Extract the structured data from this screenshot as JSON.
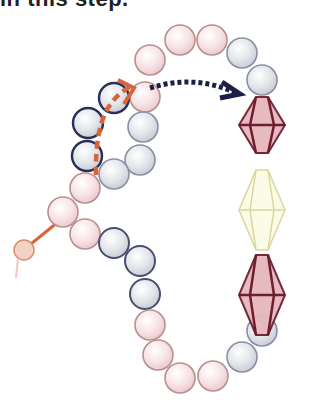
{
  "caption": "in this step.",
  "colors": {
    "pink_fill": "#f7e1e4",
    "pink_stroke": "#b8908f",
    "gray_fill": "#dfe3e8",
    "gray_stroke": "#8a8fa6",
    "dark_ring": "#2a2f58",
    "thread": "#d9643a",
    "arrow": "#1c1f45",
    "diamond_pink_fill": "#e6b7bd",
    "diamond_pink_stroke": "#6e1e30",
    "diamond_yellow_fill": "#fbfbe8",
    "diamond_yellow_stroke": "#d8d89a"
  },
  "beads": [
    {
      "type": "pink",
      "x": 150,
      "y": 60
    },
    {
      "type": "pink",
      "x": 180,
      "y": 40
    },
    {
      "type": "pink",
      "x": 212,
      "y": 40
    },
    {
      "type": "gray",
      "x": 242,
      "y": 53
    },
    {
      "type": "gray",
      "x": 262,
      "y": 80
    },
    {
      "type": "pink",
      "x": 145,
      "y": 97
    },
    {
      "type": "gray-dark",
      "x": 114,
      "y": 98
    },
    {
      "type": "gray-dark",
      "x": 88,
      "y": 123
    },
    {
      "type": "gray-dark",
      "x": 87,
      "y": 156
    },
    {
      "type": "gray",
      "x": 143,
      "y": 127
    },
    {
      "type": "gray",
      "x": 140,
      "y": 160
    },
    {
      "type": "gray",
      "x": 114,
      "y": 174
    },
    {
      "type": "pink",
      "x": 85,
      "y": 188
    },
    {
      "type": "pink",
      "x": 63,
      "y": 212
    },
    {
      "type": "pink",
      "x": 85,
      "y": 234
    },
    {
      "type": "gray-mid",
      "x": 114,
      "y": 243
    },
    {
      "type": "gray-mid",
      "x": 140,
      "y": 261
    },
    {
      "type": "gray-mid",
      "x": 145,
      "y": 294
    },
    {
      "type": "pink",
      "x": 150,
      "y": 325
    },
    {
      "type": "pink",
      "x": 158,
      "y": 355
    },
    {
      "type": "pink",
      "x": 180,
      "y": 378
    },
    {
      "type": "pink",
      "x": 213,
      "y": 376
    },
    {
      "type": "gray",
      "x": 242,
      "y": 357
    },
    {
      "type": "gray",
      "x": 262,
      "y": 331
    }
  ],
  "diamonds": [
    {
      "type": "pink",
      "cx": 262,
      "cy": 158,
      "top": 100,
      "bottom": 228
    },
    {
      "type": "yellow",
      "cx": 262,
      "cy": 208,
      "top": 170,
      "bottom": 245
    },
    {
      "type": "pink",
      "cx": 262,
      "cy": 280,
      "top": 244,
      "bottom": 316
    }
  ],
  "labels": {
    "path_arrow": "thread-path-arrow",
    "move_arrow": "move-direction-arrow"
  }
}
